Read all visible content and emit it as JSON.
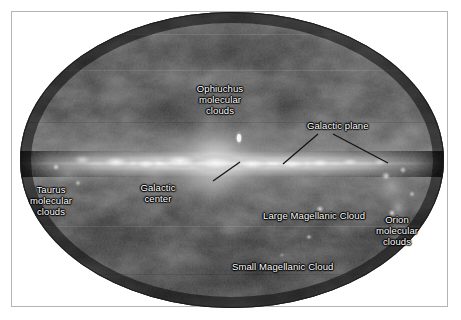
{
  "figure": {
    "type": "all-sky-map",
    "projection": "mollweide-ellipse",
    "colormap": "grayscale",
    "background_color": "#ffffff",
    "frame_color": "#b4b4b4",
    "label_color": "#ffffff",
    "caption": ""
  },
  "labels": [
    {
      "id": "ophiuchus",
      "name": "ophiuchus-molecular-clouds-label",
      "text": "Ophiuchus\nmolecular\nclouds",
      "x": 220,
      "y": 83,
      "align": "center"
    },
    {
      "id": "galactic-plane",
      "name": "galactic-plane-label",
      "text": "Galactic plane",
      "x": 307,
      "y": 120,
      "align": "left"
    },
    {
      "id": "galactic-center",
      "name": "galactic-center-label",
      "text": "Galactic\ncenter",
      "x": 158,
      "y": 182,
      "align": "center"
    },
    {
      "id": "taurus",
      "name": "taurus-molecular-clouds-label",
      "text": "Taurus\nmolecular\nclouds",
      "x": 50,
      "y": 184,
      "align": "center"
    },
    {
      "id": "lmc",
      "name": "large-magellanic-cloud-label",
      "text": "Large Magellanic Cloud",
      "x": 263,
      "y": 210,
      "align": "left"
    },
    {
      "id": "orion",
      "name": "orion-molecular-clouds-label",
      "text": "Orion\nmolecular\nclouds",
      "x": 397,
      "y": 214,
      "align": "center"
    },
    {
      "id": "smc",
      "name": "small-magellanic-cloud-label",
      "text": "Small Magellanic Cloud",
      "x": 232,
      "y": 261,
      "align": "left"
    }
  ],
  "leader_lines": [
    {
      "name": "galactic-plane-leader-left",
      "x1": 318,
      "y1": 134,
      "x2": 283,
      "y2": 164
    },
    {
      "name": "galactic-plane-leader-right",
      "x1": 333,
      "y1": 134,
      "x2": 388,
      "y2": 163
    },
    {
      "name": "galactic-center-leader",
      "x1": 213,
      "y1": 181,
      "x2": 240,
      "y2": 162
    }
  ],
  "features": {
    "galactic_plane_band": "bright horizontal ridge across ellipse center",
    "galactic_center_core": "brightest concentration near map center-left",
    "ophiuchus_knot": "bright compact knot above the plane",
    "bulge_glow": "diffuse vertical glow around galactic center"
  }
}
